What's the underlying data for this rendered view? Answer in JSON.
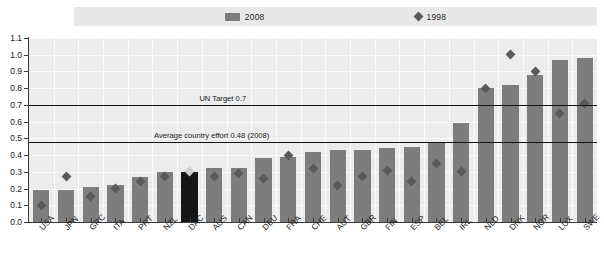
{
  "chart_data": {
    "type": "bar",
    "title": "",
    "xlabel": "",
    "ylabel": "",
    "ylim": [
      0.0,
      1.1
    ],
    "ytick_labels": [
      "0.0",
      "0.1",
      "0.2",
      "0.3",
      "0.4",
      "0.5",
      "0.6",
      "0.7",
      "0.8",
      "0.9",
      "1.0",
      "1.1"
    ],
    "ytick_values": [
      0.0,
      0.1,
      0.2,
      0.3,
      0.4,
      0.5,
      0.6,
      0.7,
      0.8,
      0.9,
      1.0,
      1.1
    ],
    "grid": true,
    "legend_position": "top",
    "categories": [
      "USA",
      "JPN",
      "GRC",
      "ITA",
      "PRT",
      "NZL",
      "DAC",
      "AUS",
      "CAN",
      "DEU",
      "FRA",
      "CHE",
      "AUT",
      "GBR",
      "FIN",
      "ESP",
      "BEL",
      "IRL",
      "NLD",
      "DNK",
      "NOR",
      "LUX",
      "SWE"
    ],
    "series": [
      {
        "name": "2008",
        "type": "bar",
        "color": "#7d7d7d",
        "highlight_category": "DAC",
        "highlight_color": "#151515",
        "values": [
          0.19,
          0.19,
          0.21,
          0.22,
          0.27,
          0.3,
          0.3,
          0.32,
          0.32,
          0.38,
          0.39,
          0.42,
          0.43,
          0.43,
          0.44,
          0.45,
          0.48,
          0.59,
          0.8,
          0.82,
          0.88,
          0.97,
          0.98
        ]
      },
      {
        "name": "1998",
        "type": "scatter",
        "color": "#5a5a5a",
        "marker": "diamond",
        "values": [
          0.1,
          0.27,
          0.15,
          0.2,
          0.24,
          0.27,
          0.3,
          0.27,
          0.29,
          0.26,
          0.4,
          0.32,
          0.22,
          0.27,
          0.31,
          0.24,
          0.35,
          0.3,
          0.8,
          1.0,
          0.9,
          0.65,
          0.71
        ]
      }
    ],
    "reference_lines": [
      {
        "label": "UN Target 0.7",
        "value": 0.7,
        "color": "#121212",
        "label_x_frac": 0.3
      },
      {
        "label": "Average country effort 0.48 (2008)",
        "value": 0.48,
        "color": "#121212",
        "label_x_frac": 0.22
      }
    ]
  },
  "legend": {
    "items": [
      {
        "label": "2008",
        "marker": "bar-swatch",
        "color": "#7d7d7d"
      },
      {
        "label": "1998",
        "marker": "diamond",
        "color": "#5a5a5a"
      }
    ]
  }
}
